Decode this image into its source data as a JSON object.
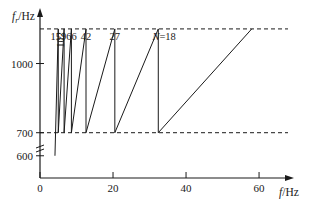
{
  "chart_data": {
    "type": "line",
    "title": "",
    "xlabel": "f/Hz",
    "ylabel": "fr/Hz",
    "xlim": [
      0,
      63
    ],
    "ylim": [
      560,
      1180
    ],
    "grid": false,
    "legend": "none",
    "xticks": [
      "0",
      "20",
      "40",
      "60"
    ],
    "xtick_values": [
      0,
      20,
      40,
      60
    ],
    "yticks": [
      "600",
      "700",
      "1000"
    ],
    "ytick_values": [
      600,
      700,
      1000
    ],
    "axis_break": true,
    "reference_lines": [
      {
        "name": "upper-dashed-line",
        "value": 1150,
        "style": "dashed"
      },
      {
        "name": "lower-dashed-line",
        "value": 700,
        "style": "dashed"
      }
    ],
    "annotations": [
      {
        "label": "159",
        "x": 5.0
      },
      {
        "label": "102",
        "x": 6.6,
        "rotated": true
      },
      {
        "label": "66",
        "x": 8.6
      },
      {
        "label": "42",
        "x": 12.6
      },
      {
        "label": "27",
        "x": 20.5
      },
      {
        "label": "N=18",
        "x": 34.0
      }
    ],
    "series": [
      {
        "name": "resonance-sawtooth",
        "comment": "sawtooth ramps from 700 Hz to 1150 Hz with vertical resets",
        "segments": [
          {
            "x": [
              4.1,
              5.0
            ],
            "y": [
              600,
              1150
            ]
          },
          {
            "x": [
              5.0,
              5.0
            ],
            "y": [
              1150,
              700
            ]
          },
          {
            "x": [
              5.0,
              6.6
            ],
            "y": [
              700,
              1150
            ]
          },
          {
            "x": [
              6.6,
              6.6
            ],
            "y": [
              1150,
              700
            ]
          },
          {
            "x": [
              6.6,
              8.6
            ],
            "y": [
              700,
              1150
            ]
          },
          {
            "x": [
              8.6,
              8.6
            ],
            "y": [
              1150,
              700
            ]
          },
          {
            "x": [
              8.6,
              12.6
            ],
            "y": [
              700,
              1150
            ]
          },
          {
            "x": [
              12.6,
              12.6
            ],
            "y": [
              1150,
              700
            ]
          },
          {
            "x": [
              12.6,
              20.5
            ],
            "y": [
              700,
              1150
            ]
          },
          {
            "x": [
              20.5,
              20.5
            ],
            "y": [
              1150,
              700
            ]
          },
          {
            "x": [
              20.5,
              32.4
            ],
            "y": [
              700,
              1150
            ]
          },
          {
            "x": [
              32.4,
              32.4
            ],
            "y": [
              1150,
              700
            ]
          },
          {
            "x": [
              32.4,
              58.0
            ],
            "y": [
              700,
              1150
            ]
          }
        ]
      }
    ]
  },
  "figure": {
    "y_axis_label": "f",
    "y_axis_label_sub": "r",
    "y_axis_unit": "/Hz",
    "x_axis_label": "f",
    "x_axis_unit": "/Hz"
  }
}
